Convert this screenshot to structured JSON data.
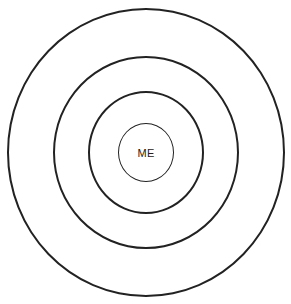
{
  "diagram": {
    "type": "concentric-circles",
    "rings": [
      {
        "id": "outer",
        "label": ""
      },
      {
        "id": "second",
        "label": ""
      },
      {
        "id": "third",
        "label": ""
      },
      {
        "id": "inner",
        "label": "ME"
      }
    ],
    "center_label": "ME",
    "colors": {
      "stroke": "#222222",
      "background": "#ffffff"
    }
  }
}
